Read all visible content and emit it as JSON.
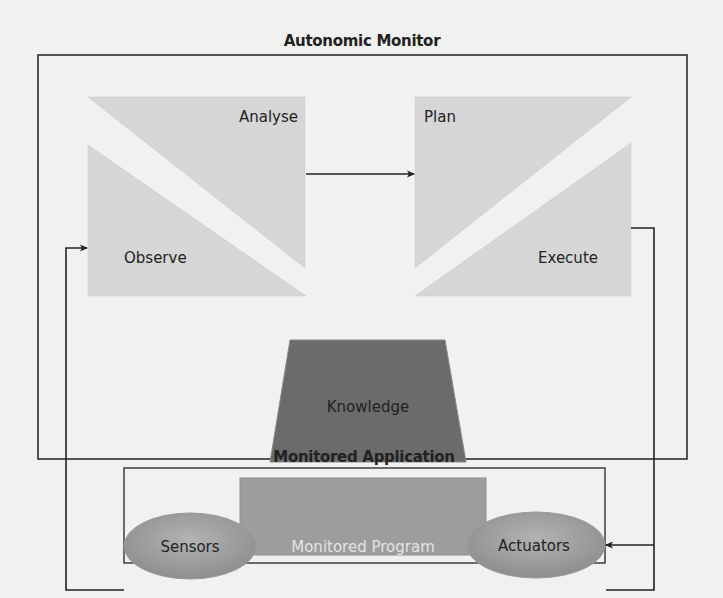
{
  "diagram": {
    "title": "Autonomic Monitor",
    "phases": {
      "analyse": "Analyse",
      "plan": "Plan",
      "observe": "Observe",
      "execute": "Execute"
    },
    "knowledge": "Knowledge",
    "application": {
      "title": "Monitored Application",
      "program": "Monitored Program",
      "sensors": "Sensors",
      "actuators": "Actuators"
    },
    "colors": {
      "phase_fill": "#d6d6d6",
      "knowledge_fill": "#6b6b6b",
      "program_fill": "#9d9d9d",
      "ellipse_fill": "#a6a6a6",
      "line": "#222222",
      "background": "#f1f1ef"
    }
  }
}
